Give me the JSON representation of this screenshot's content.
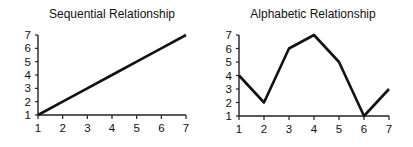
{
  "chart_data": [
    {
      "type": "line",
      "title": "Sequential Relationship",
      "xlabel": "",
      "ylabel": "",
      "x": [
        1,
        2,
        3,
        4,
        5,
        6,
        7
      ],
      "values": [
        1,
        2,
        3,
        4,
        5,
        6,
        7
      ],
      "x_ticks": [
        "1",
        "2",
        "3",
        "4",
        "5",
        "6",
        "7"
      ],
      "y_ticks": [
        "1",
        "2",
        "3",
        "4",
        "5",
        "6",
        "7"
      ],
      "xlim": [
        1,
        7
      ],
      "ylim": [
        1,
        7
      ],
      "grid": false,
      "legend": null
    },
    {
      "type": "line",
      "title": "Alphabetic Relationship",
      "xlabel": "",
      "ylabel": "",
      "x": [
        1,
        2,
        3,
        4,
        5,
        6,
        7
      ],
      "values": [
        4,
        2,
        6,
        7,
        5,
        1,
        3
      ],
      "x_ticks": [
        "1",
        "2",
        "3",
        "4",
        "5",
        "6",
        "7"
      ],
      "y_ticks": [
        "1",
        "2",
        "3",
        "4",
        "5",
        "6",
        "7"
      ],
      "xlim": [
        1,
        7
      ],
      "ylim": [
        1,
        7
      ],
      "grid": false,
      "legend": null
    }
  ],
  "style": {
    "line_color": "#111111",
    "axis_color": "#222222",
    "text_color": "#111111"
  }
}
